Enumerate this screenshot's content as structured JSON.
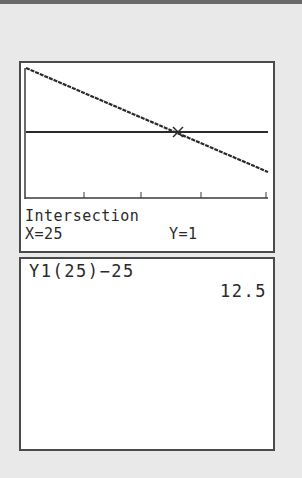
{
  "graph": {
    "mode_label": "Intersection",
    "x_label": "X=25",
    "y_label": "Y=1",
    "lines": [
      {
        "name": "Y1",
        "type": "decreasing-line",
        "style": "dotted-thick"
      },
      {
        "name": "Y2",
        "type": "horizontal-line",
        "value": 1
      }
    ],
    "intersection": {
      "x": 25,
      "y": 1
    },
    "x_ticks": 4,
    "colors": {
      "line": "#2a2a2a",
      "axis": "#3a3a3a",
      "border": "#4a4a4a",
      "background": "#ffffff"
    }
  },
  "home": {
    "entries": [
      {
        "expression": "Y1(25)−25",
        "result": "12.5"
      }
    ]
  }
}
